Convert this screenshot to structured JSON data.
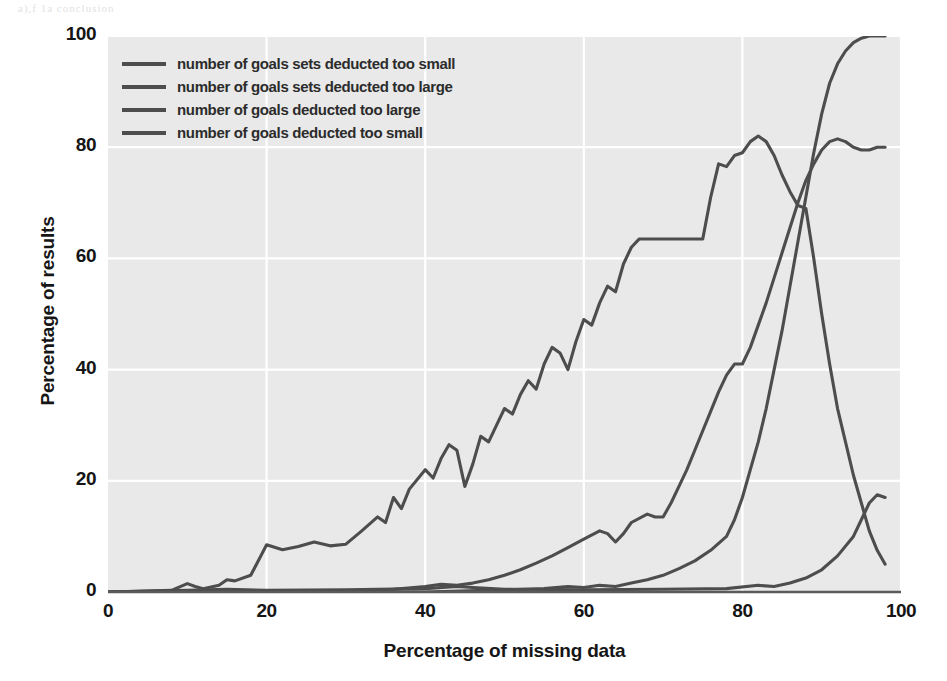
{
  "figure": {
    "background": "#ffffff",
    "plot_background": "#e9e9e9",
    "gridline_color": "#ffffff",
    "line_color": "#4d4d4d",
    "axis_color": "#555555",
    "scan_artifact_top": "a),f 1a conclusion"
  },
  "legend": {
    "position": "upper-left-inside",
    "items": [
      {
        "label": "number of goals sets deducted too small",
        "color": "#4d4d4d"
      },
      {
        "label": "number of goals sets deducted too large",
        "color": "#4d4d4d"
      },
      {
        "label": "number of goals deducted too large",
        "color": "#4d4d4d"
      },
      {
        "label": "number of goals deducted too small",
        "color": "#4d4d4d"
      }
    ]
  },
  "chart_data": {
    "type": "line",
    "title": "",
    "xlabel": "Percentage of missing data",
    "ylabel": "Percentage of results",
    "xlim": [
      0,
      100
    ],
    "ylim": [
      0,
      100
    ],
    "xticks": [
      0,
      20,
      40,
      60,
      80,
      100
    ],
    "yticks": [
      0,
      20,
      40,
      60,
      80,
      100
    ],
    "grid": true,
    "grid_axis": "both",
    "legend_position": "upper left",
    "series": [
      {
        "name": "number of goals sets deducted too small",
        "color": "#4d4d4d",
        "points": [
          [
            0,
            0
          ],
          [
            20,
            0
          ],
          [
            40,
            0
          ],
          [
            50,
            0.4
          ],
          [
            55,
            0.6
          ],
          [
            58,
            1.0
          ],
          [
            60,
            0.8
          ],
          [
            62,
            1.2
          ],
          [
            64,
            1.0
          ],
          [
            66,
            1.6
          ],
          [
            68,
            2.2
          ],
          [
            70,
            3.0
          ],
          [
            72,
            4.2
          ],
          [
            74,
            5.6
          ],
          [
            76,
            7.5
          ],
          [
            78,
            10.0
          ],
          [
            79,
            13.0
          ],
          [
            80,
            17.0
          ],
          [
            81,
            22.0
          ],
          [
            82,
            27.0
          ],
          [
            83,
            33.0
          ],
          [
            84,
            40.0
          ],
          [
            85,
            47.0
          ],
          [
            86,
            55.0
          ],
          [
            87,
            63.0
          ],
          [
            88,
            71.0
          ],
          [
            89,
            79.0
          ],
          [
            90,
            86.0
          ],
          [
            91,
            91.5
          ],
          [
            92,
            95.0
          ],
          [
            93,
            97.3
          ],
          [
            94,
            98.8
          ],
          [
            95,
            99.6
          ],
          [
            96,
            100.0
          ],
          [
            97,
            100.0
          ],
          [
            98,
            100.0
          ]
        ]
      },
      {
        "name": "number of goals sets deducted too large",
        "color": "#4d4d4d",
        "points": [
          [
            0,
            0
          ],
          [
            8,
            0.3
          ],
          [
            10,
            1.5
          ],
          [
            11,
            1.0
          ],
          [
            12,
            0.6
          ],
          [
            14,
            1.2
          ],
          [
            15,
            2.2
          ],
          [
            16,
            2.0
          ],
          [
            18,
            3.0
          ],
          [
            20,
            8.5
          ],
          [
            22,
            7.6
          ],
          [
            24,
            8.2
          ],
          [
            26,
            9.0
          ],
          [
            28,
            8.3
          ],
          [
            30,
            8.6
          ],
          [
            32,
            11.0
          ],
          [
            34,
            13.5
          ],
          [
            35,
            12.5
          ],
          [
            36,
            17.0
          ],
          [
            37,
            15.0
          ],
          [
            38,
            18.5
          ],
          [
            40,
            22.0
          ],
          [
            41,
            20.5
          ],
          [
            42,
            24.0
          ],
          [
            43,
            26.5
          ],
          [
            44,
            25.5
          ],
          [
            45,
            19.0
          ],
          [
            46,
            23.0
          ],
          [
            47,
            28.0
          ],
          [
            48,
            27.0
          ],
          [
            49,
            30.0
          ],
          [
            50,
            33.0
          ],
          [
            51,
            32.0
          ],
          [
            52,
            35.5
          ],
          [
            53,
            38.0
          ],
          [
            54,
            36.5
          ],
          [
            55,
            41.0
          ],
          [
            56,
            44.0
          ],
          [
            57,
            43.0
          ],
          [
            58,
            40.0
          ],
          [
            59,
            45.0
          ],
          [
            60,
            49.0
          ],
          [
            61,
            48.0
          ],
          [
            62,
            52.0
          ],
          [
            63,
            55.0
          ],
          [
            64,
            54.0
          ],
          [
            65,
            59.0
          ],
          [
            66,
            62.0
          ],
          [
            67,
            63.5
          ],
          [
            68,
            63.5
          ],
          [
            70,
            63.5
          ],
          [
            72,
            63.5
          ],
          [
            74,
            63.5
          ],
          [
            75,
            63.5
          ],
          [
            76,
            71.0
          ],
          [
            77,
            77.0
          ],
          [
            78,
            76.5
          ],
          [
            79,
            78.5
          ],
          [
            80,
            79.0
          ],
          [
            81,
            81.0
          ],
          [
            82,
            82.0
          ],
          [
            83,
            81.0
          ],
          [
            84,
            78.5
          ],
          [
            85,
            75.0
          ],
          [
            86,
            72.0
          ],
          [
            87,
            69.5
          ],
          [
            88,
            69.0
          ],
          [
            89,
            60.0
          ],
          [
            90,
            50.0
          ],
          [
            91,
            41.0
          ],
          [
            92,
            33.0
          ],
          [
            93,
            27.0
          ],
          [
            94,
            21.0
          ],
          [
            95,
            16.0
          ],
          [
            96,
            11.0
          ],
          [
            97,
            7.5
          ],
          [
            98,
            5.0
          ]
        ]
      },
      {
        "name": "number of goals deducted too large",
        "color": "#4d4d4d",
        "points": [
          [
            0,
            0
          ],
          [
            20,
            0
          ],
          [
            30,
            0.2
          ],
          [
            36,
            0.5
          ],
          [
            40,
            1.0
          ],
          [
            42,
            1.4
          ],
          [
            44,
            1.2
          ],
          [
            46,
            1.6
          ],
          [
            48,
            2.2
          ],
          [
            50,
            3.0
          ],
          [
            52,
            4.0
          ],
          [
            54,
            5.2
          ],
          [
            56,
            6.5
          ],
          [
            58,
            8.0
          ],
          [
            60,
            9.5
          ],
          [
            62,
            11.0
          ],
          [
            63,
            10.5
          ],
          [
            64,
            9.0
          ],
          [
            65,
            10.5
          ],
          [
            66,
            12.5
          ],
          [
            68,
            14.0
          ],
          [
            69,
            13.5
          ],
          [
            70,
            13.5
          ],
          [
            71,
            16.0
          ],
          [
            72,
            19.0
          ],
          [
            73,
            22.0
          ],
          [
            74,
            25.5
          ],
          [
            75,
            29.0
          ],
          [
            76,
            32.5
          ],
          [
            77,
            36.0
          ],
          [
            78,
            39.0
          ],
          [
            79,
            41.0
          ],
          [
            80,
            41.0
          ],
          [
            81,
            44.0
          ],
          [
            82,
            48.0
          ],
          [
            83,
            52.0
          ],
          [
            84,
            56.5
          ],
          [
            85,
            61.0
          ],
          [
            86,
            65.5
          ],
          [
            87,
            70.0
          ],
          [
            88,
            74.0
          ],
          [
            89,
            77.0
          ],
          [
            90,
            79.5
          ],
          [
            91,
            81.0
          ],
          [
            92,
            81.5
          ],
          [
            93,
            81.0
          ],
          [
            94,
            80.0
          ],
          [
            95,
            79.5
          ],
          [
            96,
            79.5
          ],
          [
            97,
            80.0
          ],
          [
            98,
            80.0
          ]
        ]
      },
      {
        "name": "number of goals deducted too small",
        "color": "#4d4d4d",
        "points": [
          [
            0,
            0
          ],
          [
            10,
            0.3
          ],
          [
            15,
            0.5
          ],
          [
            20,
            0.3
          ],
          [
            30,
            0.4
          ],
          [
            40,
            0.6
          ],
          [
            44,
            1.0
          ],
          [
            46,
            0.8
          ],
          [
            50,
            0.5
          ],
          [
            60,
            0.4
          ],
          [
            70,
            0.5
          ],
          [
            78,
            0.6
          ],
          [
            82,
            1.2
          ],
          [
            84,
            1.0
          ],
          [
            86,
            1.6
          ],
          [
            88,
            2.5
          ],
          [
            90,
            4.0
          ],
          [
            92,
            6.5
          ],
          [
            94,
            10.0
          ],
          [
            95,
            13.0
          ],
          [
            96,
            16.0
          ],
          [
            97,
            17.5
          ],
          [
            98,
            17.0
          ]
        ]
      }
    ]
  }
}
